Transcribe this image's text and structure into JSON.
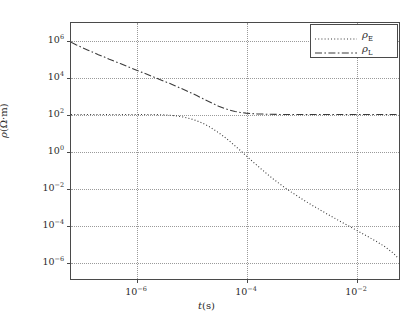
{
  "chart_data": {
    "type": "line",
    "title": "",
    "xlabel": "t(s)",
    "ylabel": "rho(Ω·m)",
    "xscale": "log",
    "yscale": "log",
    "xlim": [
      6.3e-08,
      0.063
    ],
    "ylim": [
      1e-07,
      10000000.0
    ],
    "grid": true,
    "legend_position": "upper right",
    "xticks": [
      1e-06,
      0.0001,
      0.01
    ],
    "xtick_labels": [
      "10−6",
      "10−4",
      "10−2"
    ],
    "yticks": [
      1000000.0,
      10000.0,
      100.0,
      1.0,
      0.01,
      0.0001,
      1e-06
    ],
    "ytick_labels": [
      "10⁶",
      "10⁴",
      "10²",
      "10⁰",
      "10⁻²",
      "10⁻⁴",
      "10⁻⁶"
    ],
    "series": [
      {
        "name": "ρ_E",
        "label_base": "ρ",
        "label_sub": "E",
        "linestyle": "dotted",
        "color": "#3a3a3a",
        "points_log": [
          [
            -7.2,
            2.0
          ],
          [
            -7.0,
            2.0
          ],
          [
            -6.8,
            2.0
          ],
          [
            -6.6,
            2.0
          ],
          [
            -6.4,
            2.0
          ],
          [
            -6.2,
            2.0
          ],
          [
            -6.0,
            2.0
          ],
          [
            -5.8,
            2.0
          ],
          [
            -5.6,
            1.99
          ],
          [
            -5.45,
            1.97
          ],
          [
            -5.3,
            1.93
          ],
          [
            -5.15,
            1.86
          ],
          [
            -5.0,
            1.75
          ],
          [
            -4.9,
            1.65
          ],
          [
            -4.8,
            1.53
          ],
          [
            -4.7,
            1.38
          ],
          [
            -4.6,
            1.2
          ],
          [
            -4.5,
            1.0
          ],
          [
            -4.4,
            0.78
          ],
          [
            -4.3,
            0.54
          ],
          [
            -4.2,
            0.28
          ],
          [
            -4.1,
            0.02
          ],
          [
            -4.0,
            -0.25
          ],
          [
            -3.9,
            -0.52
          ],
          [
            -3.8,
            -0.78
          ],
          [
            -3.7,
            -1.04
          ],
          [
            -3.6,
            -1.29
          ],
          [
            -3.5,
            -1.53
          ],
          [
            -3.4,
            -1.76
          ],
          [
            -3.3,
            -1.98
          ],
          [
            -3.2,
            -2.19
          ],
          [
            -3.0,
            -2.58
          ],
          [
            -2.8,
            -2.95
          ],
          [
            -2.6,
            -3.3
          ],
          [
            -2.4,
            -3.64
          ],
          [
            -2.2,
            -3.97
          ],
          [
            -2.0,
            -4.3
          ],
          [
            -1.8,
            -4.63
          ],
          [
            -1.6,
            -4.97
          ],
          [
            -1.45,
            -5.25
          ],
          [
            -1.3,
            -5.6
          ],
          [
            -1.22,
            -5.85
          ]
        ]
      },
      {
        "name": "ρ_L",
        "label_base": "ρ",
        "label_sub": "L",
        "linestyle": "dashdot",
        "color": "#3a3a3a",
        "points_log": [
          [
            -7.2,
            5.95
          ],
          [
            -7.1,
            5.8
          ],
          [
            -7.0,
            5.66
          ],
          [
            -6.9,
            5.53
          ],
          [
            -6.8,
            5.4
          ],
          [
            -6.7,
            5.27
          ],
          [
            -6.6,
            5.15
          ],
          [
            -6.5,
            5.02
          ],
          [
            -6.4,
            4.9
          ],
          [
            -6.3,
            4.78
          ],
          [
            -6.2,
            4.66
          ],
          [
            -6.1,
            4.54
          ],
          [
            -6.0,
            4.42
          ],
          [
            -5.9,
            4.3
          ],
          [
            -5.8,
            4.18
          ],
          [
            -5.7,
            4.06
          ],
          [
            -5.6,
            3.94
          ],
          [
            -5.5,
            3.82
          ],
          [
            -5.4,
            3.7
          ],
          [
            -5.3,
            3.57
          ],
          [
            -5.2,
            3.44
          ],
          [
            -5.1,
            3.31
          ],
          [
            -5.0,
            3.17
          ],
          [
            -4.9,
            3.03
          ],
          [
            -4.8,
            2.88
          ],
          [
            -4.7,
            2.73
          ],
          [
            -4.6,
            2.59
          ],
          [
            -4.5,
            2.45
          ],
          [
            -4.4,
            2.33
          ],
          [
            -4.3,
            2.24
          ],
          [
            -4.2,
            2.16
          ],
          [
            -4.1,
            2.11
          ],
          [
            -4.0,
            2.07
          ],
          [
            -3.9,
            2.05
          ],
          [
            -3.8,
            2.03
          ],
          [
            -3.7,
            2.02
          ],
          [
            -3.6,
            2.01
          ],
          [
            -3.4,
            2.0
          ],
          [
            -3.2,
            2.0
          ],
          [
            -3.0,
            2.0
          ],
          [
            -2.6,
            2.0
          ],
          [
            -2.2,
            2.0
          ],
          [
            -1.8,
            2.0
          ],
          [
            -1.5,
            2.0
          ],
          [
            -1.22,
            2.0
          ]
        ]
      }
    ]
  },
  "axes": {
    "ylabel_rho": "ρ",
    "ylabel_paren": "(Ω·m)",
    "xlabel_t": "t",
    "xlabel_paren": "(s)"
  },
  "legend": {
    "entries": [
      {
        "base": "ρ",
        "sub": "E"
      },
      {
        "base": "ρ",
        "sub": "L"
      }
    ]
  }
}
